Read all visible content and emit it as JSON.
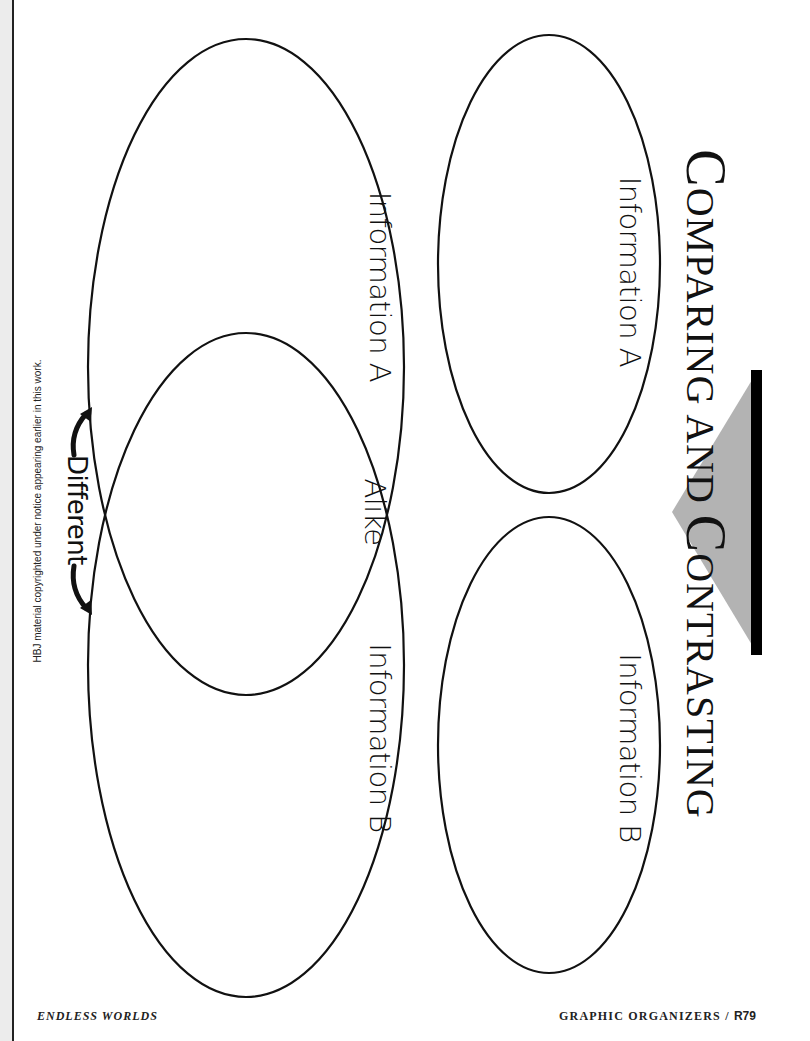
{
  "title": {
    "word1_cap": "C",
    "word1_rest": "OMPARING",
    "word2": "AND",
    "word3_cap": "C",
    "word3_rest": "ONTRASTING"
  },
  "venn": {
    "circle_a_label": "Information A",
    "circle_b_label": "Information B",
    "overlap_label": "Alike",
    "outer_label": "Different"
  },
  "separate_ovals": {
    "oval_a_label": "Information A",
    "oval_b_label": "Information B"
  },
  "copyright": "HBJ material copyrighted under notice appearing earlier in this work.",
  "footer": {
    "left": "ENDLESS WORLDS",
    "right_section": "GRAPHIC ORGANIZERS / ",
    "right_page": "R79"
  },
  "colors": {
    "line": "#111111",
    "accent_gray": "#b3b3b3",
    "accent_bar": "#000000"
  }
}
